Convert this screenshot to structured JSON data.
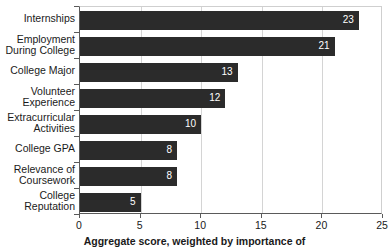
{
  "chart_data": {
    "type": "bar",
    "orientation": "horizontal",
    "title": "",
    "xlabel": "Aggregate score, weighted by importance of",
    "ylabel": "",
    "xlim": [
      0,
      25
    ],
    "xticks": [
      0,
      5,
      10,
      15,
      20,
      25
    ],
    "grid": true,
    "legend": false,
    "bar_color": "#2b2b2b",
    "value_label_color": "#ffffff",
    "categories": [
      "Internships",
      "Employment During College",
      "College Major",
      "Volunteer Experience",
      "Extracurricular Activities",
      "College GPA",
      "Relevance of Coursework",
      "College Reputation"
    ],
    "category_lines": [
      [
        "Internships"
      ],
      [
        "Employment",
        "During College"
      ],
      [
        "College Major"
      ],
      [
        "Volunteer",
        "Experience"
      ],
      [
        "Extracurricular",
        "Activities"
      ],
      [
        "College GPA"
      ],
      [
        "Relevance of",
        "Coursework"
      ],
      [
        "College",
        "Reputation"
      ]
    ],
    "values": [
      23,
      21,
      13,
      12,
      10,
      8,
      8,
      5
    ],
    "value_labels": [
      "23",
      "21",
      "13",
      "12",
      "10",
      "8",
      "8",
      "5"
    ],
    "xtick_labels": [
      "0",
      "5",
      "10",
      "15",
      "20",
      "25"
    ]
  }
}
